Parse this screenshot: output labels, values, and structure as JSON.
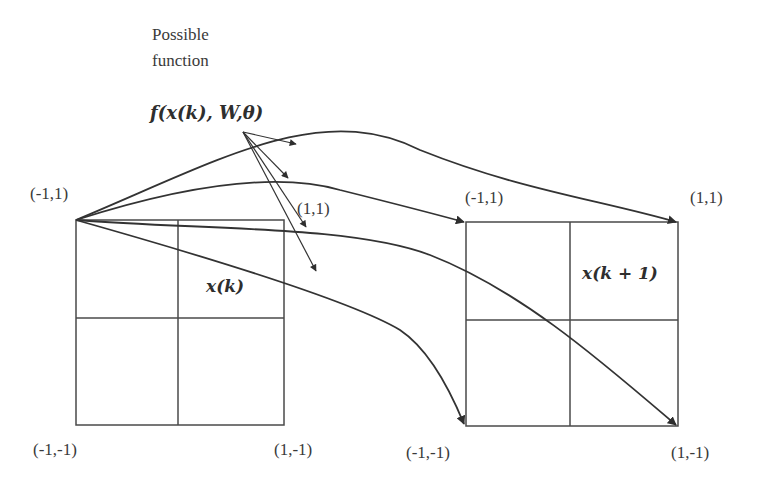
{
  "diagram": {
    "caption_line1": "Possible",
    "caption_line2": "function",
    "function_label": "f(x(k), W,θ)",
    "left_grid": {
      "state_label": "x(k)",
      "corners": {
        "top_left": "(-1,1)",
        "top_right": "(1,1)",
        "bottom_left": "(-1,-1)",
        "bottom_right": "(1,-1)"
      }
    },
    "right_grid": {
      "state_label": "x(k + 1)",
      "corners": {
        "top_left": "(-1,1)",
        "top_right": "(1,1)",
        "bottom_left": "(-1,-1)",
        "bottom_right": "(1,-1)"
      }
    },
    "mappings": [
      {
        "from": "(-1,1)",
        "to": "(-1,1)"
      },
      {
        "from": "(-1,1)",
        "to": "(1,1)"
      },
      {
        "from": "(-1,1)",
        "to": "(-1,-1)"
      },
      {
        "from": "(-1,1)",
        "to": "(1,-1)"
      }
    ],
    "colors": {
      "stroke": "#3a3a3a",
      "background": "#ffffff"
    }
  }
}
